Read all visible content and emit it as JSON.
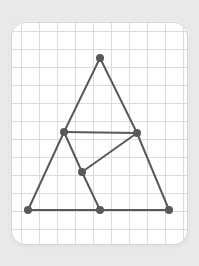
{
  "canvas": {
    "width": 199,
    "height": 266,
    "background_color": "#e9e9e9"
  },
  "card": {
    "label": "grid-paper-card",
    "x": 11,
    "y": 22,
    "width": 177,
    "height": 223,
    "background_color": "#ffffff",
    "border_color": "#d4d4d4",
    "corner_radius": 14
  },
  "grid": {
    "label": "graph-paper-grid",
    "spacing": 18,
    "origin_x": 9,
    "origin_y": 8,
    "line_color": "#dcdcdc",
    "line_width": 1
  },
  "figure": {
    "label": "triangle-line-figure",
    "stroke_color": "#58595b",
    "stroke_width": 2,
    "vertex_color": "#58595b",
    "vertex_radius": 4,
    "vertices": [
      {
        "id": "apex",
        "name": "top-apex-vertex",
        "x": 99,
        "y": 57
      },
      {
        "id": "mid_left",
        "name": "mid-left-vertex",
        "x": 63,
        "y": 131
      },
      {
        "id": "mid_right",
        "name": "mid-right-vertex",
        "x": 136,
        "y": 132
      },
      {
        "id": "center",
        "name": "center-vertex",
        "x": 81,
        "y": 171
      },
      {
        "id": "bottom_left",
        "name": "bottom-left-vertex",
        "x": 27,
        "y": 209
      },
      {
        "id": "bottom_mid",
        "name": "bottom-middle-vertex",
        "x": 99,
        "y": 209
      },
      {
        "id": "bottom_right",
        "name": "bottom-right-vertex",
        "x": 168,
        "y": 209
      }
    ],
    "edges": [
      {
        "id": "e1",
        "name": "edge-apex-to-mid-left",
        "from": "apex",
        "to": "mid_left"
      },
      {
        "id": "e2",
        "name": "edge-apex-to-mid-right",
        "from": "apex",
        "to": "mid_right"
      },
      {
        "id": "e3",
        "name": "edge-mid-left-to-mid-right",
        "from": "mid_left",
        "to": "mid_right"
      },
      {
        "id": "e4",
        "name": "edge-mid-left-to-bottom-left",
        "from": "mid_left",
        "to": "bottom_left"
      },
      {
        "id": "e5",
        "name": "edge-mid-right-to-bottom-right",
        "from": "mid_right",
        "to": "bottom_right"
      },
      {
        "id": "e6",
        "name": "edge-mid-left-to-center",
        "from": "mid_left",
        "to": "center"
      },
      {
        "id": "e7",
        "name": "edge-center-to-mid-right",
        "from": "center",
        "to": "mid_right"
      },
      {
        "id": "e8",
        "name": "edge-center-to-bottom-mid",
        "from": "center",
        "to": "bottom_mid"
      },
      {
        "id": "e9",
        "name": "edge-bottom-left-to-bottom-mid",
        "from": "bottom_left",
        "to": "bottom_mid"
      },
      {
        "id": "e10",
        "name": "edge-bottom-mid-to-bottom-right",
        "from": "bottom_mid",
        "to": "bottom_right"
      }
    ]
  }
}
